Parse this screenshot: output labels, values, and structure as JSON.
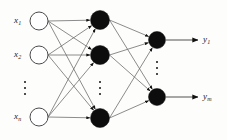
{
  "figure": {
    "kind": "neural-network-diagram",
    "title": "",
    "background_color": "#fdfdfc",
    "edge_color": "#6e6e6e",
    "output_line_color": "#8a8a8a",
    "input_node_fill": "#ffffff",
    "input_node_stroke": "#4a4a4a",
    "hidden_node_fill": "#0d0d0d",
    "output_node_fill": "#0d0d0d"
  },
  "layers": {
    "input": {
      "name": "input-layer",
      "x": 39,
      "radius": 9,
      "nodes": [
        {
          "id": "x1",
          "cy": 21,
          "label": "x",
          "sub": "1"
        },
        {
          "id": "x2",
          "cy": 55,
          "label": "x",
          "sub": "2"
        },
        {
          "id": "xn",
          "cy": 117,
          "label": "x",
          "sub": "n"
        }
      ],
      "ellipsis": {
        "cx": 25,
        "cy": 88
      }
    },
    "hidden": {
      "name": "hidden-layer",
      "x": 100,
      "radius": 9.5,
      "nodes": [
        {
          "id": "h1",
          "cy": 20
        },
        {
          "id": "h2",
          "cy": 55
        },
        {
          "id": "hk",
          "cy": 118
        }
      ],
      "ellipsis": {
        "cx": 100,
        "cy": 88
      }
    },
    "output": {
      "name": "output-layer",
      "x": 157,
      "radius": 8.5,
      "nodes": [
        {
          "id": "y1",
          "cy": 40,
          "label": "y",
          "sub": "1"
        },
        {
          "id": "ym",
          "cy": 97,
          "label": "y",
          "sub": "m"
        }
      ],
      "ellipsis": {
        "cx": 157,
        "cy": 68
      }
    }
  },
  "output_arrows": [
    {
      "id": "out1",
      "x1": 166,
      "x2": 198,
      "y": 40
    },
    {
      "id": "outm",
      "x1": 166,
      "x2": 198,
      "y": 97
    }
  ],
  "labels": {
    "input": [
      {
        "id": "label-x1",
        "text": "x",
        "sub": "1",
        "left": 14,
        "top": 16
      },
      {
        "id": "label-x2",
        "text": "x",
        "sub": "2",
        "left": 14,
        "top": 50
      },
      {
        "id": "label-xn",
        "text": "x",
        "sub": "n",
        "left": 14,
        "top": 112
      }
    ],
    "output": [
      {
        "id": "label-y1",
        "text": "y",
        "sub": "1",
        "left": 203,
        "top": 35
      },
      {
        "id": "label-ym",
        "text": "y",
        "sub": "m",
        "left": 203,
        "top": 92
      }
    ]
  }
}
